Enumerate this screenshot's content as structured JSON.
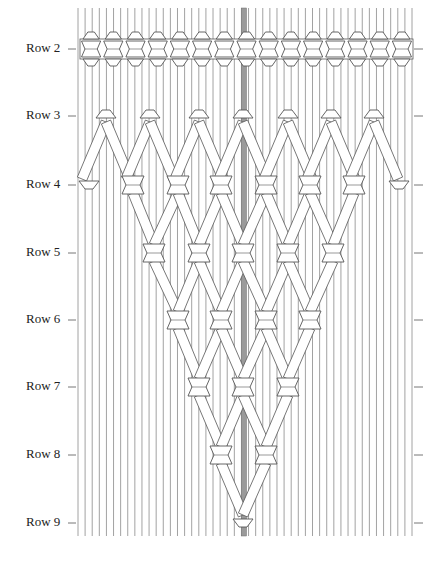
{
  "diagram": {
    "row_labels": [
      "Row 2",
      "Row 3",
      "Row 4",
      "Row 5",
      "Row 6",
      "Row 7",
      "Row 8",
      "Row 9"
    ],
    "colors": {
      "cord_stroke": "#8a8a8a",
      "center_cord": "#9a9a9a",
      "knot_fill": "#ffffff",
      "knot_stroke": "#555555",
      "tick": "#777777",
      "label": "#222222"
    },
    "cord_count": 48,
    "row2_knot_count": 15,
    "v_pattern": {
      "apex_row": "Row 9",
      "description": "Square knots forming descending V panel converging at center cord"
    }
  }
}
